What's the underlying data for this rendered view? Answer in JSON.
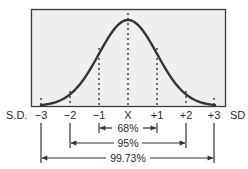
{
  "diagram": {
    "axis_left_label": "S.D.",
    "axis_right_label": "SD",
    "colors": {
      "plot_background": "#efefef",
      "frame": "#3a3a3a",
      "curve": "#333333",
      "text": "#2a2a2a",
      "page_background": "#ffffff"
    },
    "ticks": [
      {
        "label": "−3",
        "sd": -3
      },
      {
        "label": "−2",
        "sd": -2
      },
      {
        "label": "−1",
        "sd": -1
      },
      {
        "label": "X",
        "sd": 0
      },
      {
        "label": "+1",
        "sd": 1
      },
      {
        "label": "+2",
        "sd": 2
      },
      {
        "label": "+3",
        "sd": 3
      }
    ],
    "ranges": [
      {
        "label": "68%",
        "from": -1,
        "to": 1
      },
      {
        "label": "95%",
        "from": -2,
        "to": 2
      },
      {
        "label": "99.73%",
        "from": -3,
        "to": 3
      }
    ]
  }
}
